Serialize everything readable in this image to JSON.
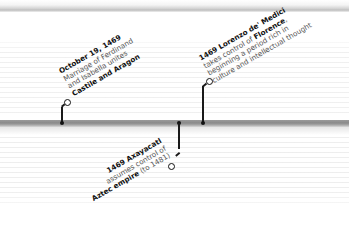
{
  "timeline": {
    "colors": {
      "bar": "#8f8f8f",
      "connector": "#1a1a1a",
      "text": "#555555",
      "emphasis": "#111111"
    },
    "events": [
      {
        "id": "ferdinand-isabella",
        "date": "October 19, 1469",
        "line1": "Marriage of Ferdinand",
        "line2": "and Isabella unites",
        "line3": "Castile and Aragon",
        "position": "above"
      },
      {
        "id": "lorenzo-medici",
        "year_name": "1469 Lorenzo de' Medici",
        "line1_pre": "takes control of ",
        "line1_bold": "Florence",
        "line1_post": ",",
        "line2": "beginning a period rich in",
        "line3": "culture and intellectual thought",
        "position": "above"
      },
      {
        "id": "axayacatl",
        "year_name": "1469 Axayacatl",
        "line1": "assumes control of",
        "line2_bold": "Aztec empire",
        "line2_post": " (to 1481)",
        "position": "below"
      }
    ]
  }
}
